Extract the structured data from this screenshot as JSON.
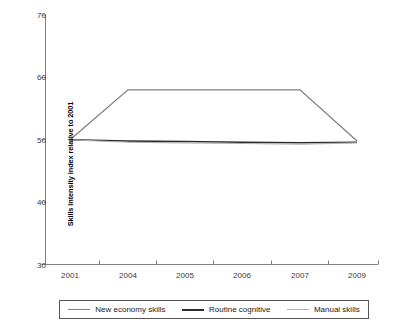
{
  "chart_data": {
    "type": "line",
    "title": "",
    "xlabel": "",
    "ylabel": "Skills intensity index relative to 2001",
    "x": [
      "2001",
      "2004",
      "2005",
      "2006",
      "2007",
      "2009"
    ],
    "tick_labels": {
      "x": [
        "2001",
        "2004",
        "2005",
        "2006",
        "2007",
        "2009"
      ],
      "y": [
        "30",
        "40",
        "50",
        "60",
        "70"
      ]
    },
    "ylim": [
      30,
      70
    ],
    "yticks": [
      30,
      40,
      50,
      60,
      70
    ],
    "grid": false,
    "legend_position": "bottom",
    "series": [
      {
        "name": "New economy skills",
        "color": "#808080",
        "values": [
          50.0,
          58.0,
          58.0,
          58.0,
          58.0,
          49.8
        ]
      },
      {
        "name": "Routine cognitive",
        "color": "#2b2b2b",
        "values": [
          50.0,
          49.8,
          49.7,
          49.6,
          49.5,
          49.6
        ]
      },
      {
        "name": "Manual skills",
        "color": "#b0b0b0",
        "values": [
          50.0,
          49.6,
          49.5,
          49.4,
          49.3,
          49.5
        ]
      }
    ]
  },
  "legend": {
    "items": [
      {
        "label": "New economy skills",
        "color": "#808080",
        "width": "1.6px"
      },
      {
        "label": "Routine cognitive",
        "color": "#2b2b2b",
        "width": "2.2px"
      },
      {
        "label": "Manual skills",
        "color": "#b0b0b0",
        "width": "1.4px"
      }
    ]
  },
  "axes": {
    "y_title": "Skills intensity index relative to 2001",
    "y_ticks": [
      "70",
      "60",
      "50",
      "40",
      "30"
    ],
    "x_ticks": [
      "2001",
      "2004",
      "2005",
      "2006",
      "2007",
      "2009"
    ],
    "axis_color": "#777777"
  }
}
